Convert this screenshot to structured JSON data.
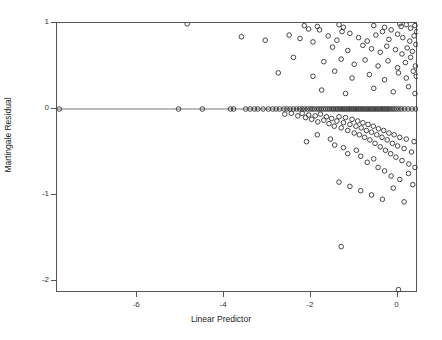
{
  "chart_data": {
    "type": "scatter",
    "title": "",
    "xlabel": "Linear Predictor",
    "ylabel": "Martingale Residual",
    "xlim": [
      -7.85,
      0.47
    ],
    "ylim": [
      -2.14,
      1.0
    ],
    "xticks": [
      -6,
      -4,
      -2,
      0
    ],
    "xticklabels": [
      "-6",
      "-4",
      "-2",
      "0"
    ],
    "yticks": [
      1,
      0,
      -1,
      -2
    ],
    "yticklabels": [
      "1",
      "0",
      "-1",
      "-2"
    ],
    "grid": false,
    "legend": null,
    "marker": "open-circle",
    "marker_color": "#333333",
    "reference_line": {
      "axis": "horizontal",
      "value": 0,
      "color": "#777777"
    },
    "points": [
      [
        -7.8,
        0.0
      ],
      [
        -5.05,
        0.0
      ],
      [
        -4.5,
        0.0
      ],
      [
        -3.85,
        0.0
      ],
      [
        -3.78,
        0.0
      ],
      [
        -3.5,
        0.0
      ],
      [
        -3.4,
        0.0
      ],
      [
        -3.3,
        0.0
      ],
      [
        -3.22,
        0.0
      ],
      [
        -3.1,
        0.0
      ],
      [
        -2.98,
        0.0
      ],
      [
        -2.88,
        0.0
      ],
      [
        -2.8,
        0.0
      ],
      [
        -2.72,
        0.0
      ],
      [
        -2.62,
        0.0
      ],
      [
        -2.55,
        0.0
      ],
      [
        -2.48,
        0.0
      ],
      [
        -2.4,
        0.0
      ],
      [
        -2.33,
        0.0
      ],
      [
        -2.26,
        0.0
      ],
      [
        -2.2,
        0.0
      ],
      [
        -2.14,
        0.0
      ],
      [
        -2.08,
        0.0
      ],
      [
        -2.02,
        0.0
      ],
      [
        -1.97,
        0.0
      ],
      [
        -1.92,
        0.0
      ],
      [
        -1.86,
        0.0
      ],
      [
        -1.81,
        0.0
      ],
      [
        -1.76,
        0.0
      ],
      [
        -1.71,
        0.0
      ],
      [
        -1.66,
        0.0
      ],
      [
        -1.61,
        0.0
      ],
      [
        -1.56,
        0.0
      ],
      [
        -1.51,
        0.0
      ],
      [
        -1.47,
        0.0
      ],
      [
        -1.42,
        0.0
      ],
      [
        -1.38,
        0.0
      ],
      [
        -1.34,
        0.0
      ],
      [
        -1.3,
        0.0
      ],
      [
        -1.26,
        0.0
      ],
      [
        -1.22,
        0.0
      ],
      [
        -1.18,
        0.0
      ],
      [
        -1.14,
        0.0
      ],
      [
        -1.1,
        0.0
      ],
      [
        -1.06,
        0.0
      ],
      [
        -1.02,
        0.0
      ],
      [
        -0.98,
        0.0
      ],
      [
        -0.94,
        0.0
      ],
      [
        -0.9,
        0.0
      ],
      [
        -0.86,
        0.0
      ],
      [
        -0.82,
        0.0
      ],
      [
        -0.78,
        0.0
      ],
      [
        -0.74,
        0.0
      ],
      [
        -0.7,
        0.0
      ],
      [
        -0.66,
        0.0
      ],
      [
        -0.62,
        0.0
      ],
      [
        -0.58,
        0.0
      ],
      [
        -0.54,
        0.0
      ],
      [
        -0.5,
        0.0
      ],
      [
        -0.46,
        0.0
      ],
      [
        -0.42,
        0.0
      ],
      [
        -0.38,
        0.0
      ],
      [
        -0.34,
        0.0
      ],
      [
        -0.3,
        0.0
      ],
      [
        -0.26,
        0.0
      ],
      [
        -0.22,
        0.0
      ],
      [
        -0.18,
        0.0
      ],
      [
        -0.13,
        0.0
      ],
      [
        -0.08,
        0.0
      ],
      [
        -0.03,
        0.0
      ],
      [
        0.03,
        0.0
      ],
      [
        0.09,
        0.0
      ],
      [
        0.16,
        0.0
      ],
      [
        0.24,
        0.0
      ],
      [
        0.33,
        0.0
      ],
      [
        0.42,
        0.0
      ],
      [
        -2.6,
        -0.06
      ],
      [
        -2.45,
        -0.05
      ],
      [
        -2.3,
        -0.08
      ],
      [
        -2.2,
        -0.05
      ],
      [
        -2.12,
        -0.1
      ],
      [
        -2.05,
        -0.07
      ],
      [
        -1.98,
        -0.12
      ],
      [
        -1.9,
        -0.08
      ],
      [
        -1.84,
        -0.15
      ],
      [
        -1.78,
        -0.06
      ],
      [
        -1.7,
        -0.13
      ],
      [
        -1.64,
        -0.09
      ],
      [
        -1.58,
        -0.17
      ],
      [
        -1.52,
        -0.11
      ],
      [
        -1.46,
        -0.2
      ],
      [
        -1.4,
        -0.14
      ],
      [
        -1.35,
        -0.09
      ],
      [
        -1.3,
        -0.22
      ],
      [
        -1.25,
        -0.16
      ],
      [
        -1.2,
        -0.1
      ],
      [
        -1.15,
        -0.25
      ],
      [
        -1.1,
        -0.18
      ],
      [
        -1.05,
        -0.12
      ],
      [
        -1.0,
        -0.28
      ],
      [
        -0.96,
        -0.2
      ],
      [
        -0.92,
        -0.14
      ],
      [
        -0.88,
        -0.3
      ],
      [
        -0.84,
        -0.22
      ],
      [
        -0.8,
        -0.16
      ],
      [
        -0.76,
        -0.33
      ],
      [
        -0.72,
        -0.25
      ],
      [
        -0.68,
        -0.18
      ],
      [
        -0.64,
        -0.36
      ],
      [
        -0.6,
        -0.27
      ],
      [
        -0.56,
        -0.2
      ],
      [
        -0.52,
        -0.4
      ],
      [
        -0.48,
        -0.3
      ],
      [
        -0.44,
        -0.23
      ],
      [
        -0.4,
        -0.44
      ],
      [
        -0.36,
        -0.33
      ],
      [
        -0.32,
        -0.25
      ],
      [
        -0.28,
        -0.48
      ],
      [
        -0.24,
        -0.36
      ],
      [
        -0.2,
        -0.28
      ],
      [
        -0.16,
        -0.52
      ],
      [
        -0.12,
        -0.4
      ],
      [
        -0.08,
        -0.3
      ],
      [
        -0.04,
        -0.56
      ],
      [
        0.0,
        -0.43
      ],
      [
        0.05,
        -0.33
      ],
      [
        0.1,
        -0.6
      ],
      [
        0.15,
        -0.46
      ],
      [
        0.2,
        -0.35
      ],
      [
        0.26,
        -0.64
      ],
      [
        0.32,
        -0.5
      ],
      [
        0.38,
        -0.38
      ],
      [
        -1.55,
        -0.35
      ],
      [
        -1.45,
        -0.42
      ],
      [
        -1.25,
        -0.45
      ],
      [
        -1.15,
        -0.52
      ],
      [
        -0.95,
        -0.48
      ],
      [
        -0.85,
        -0.55
      ],
      [
        -0.7,
        -0.62
      ],
      [
        -0.55,
        -0.58
      ],
      [
        -0.45,
        -0.68
      ],
      [
        -0.3,
        -0.72
      ],
      [
        -0.15,
        -0.78
      ],
      [
        0.05,
        -0.82
      ],
      [
        0.25,
        -0.75
      ],
      [
        0.4,
        -0.68
      ],
      [
        -2.1,
        -0.38
      ],
      [
        -1.85,
        -0.3
      ],
      [
        -1.35,
        -0.85
      ],
      [
        -1.1,
        -0.9
      ],
      [
        -0.85,
        -0.95
      ],
      [
        -0.6,
        -1.0
      ],
      [
        -0.35,
        -1.05
      ],
      [
        -0.1,
        -0.92
      ],
      [
        0.15,
        -1.08
      ],
      [
        0.35,
        -0.88
      ],
      [
        -1.3,
        -1.6
      ],
      [
        0.02,
        -2.1
      ],
      [
        -4.85,
        0.99
      ],
      [
        -2.15,
        0.97
      ],
      [
        -2.05,
        0.93
      ],
      [
        -1.85,
        0.96
      ],
      [
        -1.8,
        0.92
      ],
      [
        -1.35,
        0.98
      ],
      [
        -1.25,
        0.95
      ],
      [
        -1.28,
        0.9
      ],
      [
        -0.55,
        0.97
      ],
      [
        -0.3,
        0.95
      ],
      [
        -0.15,
        0.92
      ],
      [
        0.05,
        0.99
      ],
      [
        0.08,
        0.96
      ],
      [
        0.2,
        0.98
      ],
      [
        0.3,
        0.94
      ],
      [
        0.4,
        0.97
      ],
      [
        -3.6,
        0.84
      ],
      [
        -3.05,
        0.8
      ],
      [
        -2.5,
        0.86
      ],
      [
        -2.25,
        0.82
      ],
      [
        -1.95,
        0.78
      ],
      [
        -1.6,
        0.85
      ],
      [
        -1.4,
        0.8
      ],
      [
        -1.1,
        0.88
      ],
      [
        -0.9,
        0.83
      ],
      [
        -0.7,
        0.79
      ],
      [
        -0.5,
        0.86
      ],
      [
        -0.35,
        0.9
      ],
      [
        -0.2,
        0.81
      ],
      [
        0.0,
        0.87
      ],
      [
        0.12,
        0.83
      ],
      [
        0.28,
        0.79
      ],
      [
        0.38,
        0.85
      ],
      [
        0.44,
        0.9
      ],
      [
        -1.5,
        0.72
      ],
      [
        -1.15,
        0.68
      ],
      [
        -0.8,
        0.74
      ],
      [
        -0.6,
        0.7
      ],
      [
        -0.4,
        0.66
      ],
      [
        -0.25,
        0.73
      ],
      [
        -0.05,
        0.69
      ],
      [
        0.1,
        0.64
      ],
      [
        0.22,
        0.71
      ],
      [
        0.34,
        0.67
      ],
      [
        0.42,
        0.75
      ],
      [
        -2.4,
        0.6
      ],
      [
        -1.7,
        0.55
      ],
      [
        -1.3,
        0.58
      ],
      [
        -1.0,
        0.52
      ],
      [
        -0.75,
        0.57
      ],
      [
        -0.45,
        0.5
      ],
      [
        -0.22,
        0.56
      ],
      [
        0.0,
        0.48
      ],
      [
        0.18,
        0.54
      ],
      [
        0.3,
        0.6
      ],
      [
        0.41,
        0.5
      ],
      [
        -2.75,
        0.42
      ],
      [
        -1.95,
        0.38
      ],
      [
        -1.45,
        0.44
      ],
      [
        -1.05,
        0.36
      ],
      [
        -0.65,
        0.4
      ],
      [
        -0.3,
        0.34
      ],
      [
        0.02,
        0.42
      ],
      [
        0.2,
        0.36
      ],
      [
        0.36,
        0.44
      ],
      [
        0.43,
        0.38
      ],
      [
        -1.75,
        0.22
      ],
      [
        -1.2,
        0.18
      ],
      [
        -0.55,
        0.24
      ],
      [
        -0.1,
        0.2
      ],
      [
        0.25,
        0.26
      ],
      [
        0.4,
        0.18
      ]
    ]
  }
}
